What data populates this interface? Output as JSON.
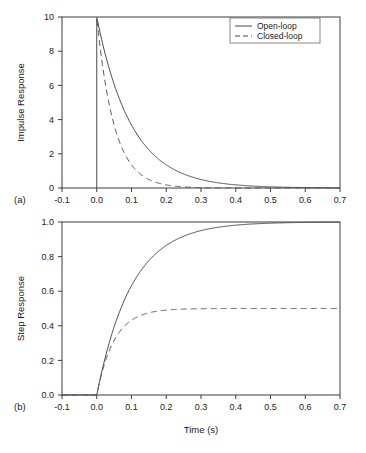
{
  "figure": {
    "background": "#ffffff",
    "line_color": "#4a4a4a",
    "axis_color": "#3c3c3c"
  },
  "caption": {
    "text": ""
  },
  "chart_data": [
    {
      "type": "line",
      "panel": "(a)",
      "title": "",
      "xlabel": "",
      "ylabel": "Impulse Response",
      "xlim": [
        -0.1,
        0.7
      ],
      "ylim": [
        0,
        10
      ],
      "xticks": [
        "-0.1",
        "0.0",
        "0.1",
        "0.2",
        "0.3",
        "0.4",
        "0.5",
        "0.6",
        "0.7"
      ],
      "xtick_values": [
        -0.1,
        0.0,
        0.1,
        0.2,
        0.3,
        0.4,
        0.5,
        0.6,
        0.7
      ],
      "yticks": [
        "0",
        "2",
        "4",
        "6",
        "8",
        "10"
      ],
      "ytick_values": [
        0,
        2,
        4,
        6,
        8,
        10
      ],
      "grid": false,
      "legend_position": "upper right",
      "series": [
        {
          "name": "Open-loop",
          "style": "solid",
          "model": "impulse_exponential",
          "peak": 10,
          "tau": 0.1,
          "x": [
            0.0,
            0.025,
            0.05,
            0.075,
            0.1,
            0.125,
            0.15,
            0.175,
            0.2,
            0.25,
            0.3,
            0.35,
            0.4,
            0.45,
            0.5,
            0.55,
            0.6,
            0.65,
            0.7
          ],
          "values": [
            10.0,
            7.79,
            6.07,
            4.72,
            3.68,
            2.87,
            2.23,
            1.74,
            1.35,
            0.82,
            0.5,
            0.3,
            0.18,
            0.11,
            0.067,
            0.041,
            0.025,
            0.015,
            0.009
          ]
        },
        {
          "name": "Closed-loop",
          "style": "dashed",
          "model": "impulse_exponential",
          "peak": 10,
          "tau": 0.05,
          "x": [
            0.0,
            0.025,
            0.05,
            0.075,
            0.1,
            0.125,
            0.15,
            0.175,
            0.2,
            0.25,
            0.3,
            0.35,
            0.4,
            0.45,
            0.5,
            0.55,
            0.6,
            0.65,
            0.7
          ],
          "values": [
            10.0,
            6.07,
            3.68,
            2.23,
            1.35,
            0.82,
            0.5,
            0.3,
            0.18,
            0.067,
            0.025,
            0.009,
            0.003,
            0.001,
            0.0,
            0.0,
            0.0,
            0.0,
            0.0
          ]
        }
      ]
    },
    {
      "type": "line",
      "panel": "(b)",
      "title": "",
      "xlabel": "Time (s)",
      "ylabel": "Step Response",
      "xlim": [
        -0.1,
        0.7
      ],
      "ylim": [
        0.0,
        1.0
      ],
      "xticks": [
        "-0.1",
        "0.0",
        "0.1",
        "0.2",
        "0.3",
        "0.4",
        "0.5",
        "0.6",
        "0.7"
      ],
      "xtick_values": [
        -0.1,
        0.0,
        0.1,
        0.2,
        0.3,
        0.4,
        0.5,
        0.6,
        0.7
      ],
      "yticks": [
        "0.0",
        "0.2",
        "0.4",
        "0.6",
        "0.8",
        "1.0"
      ],
      "ytick_values": [
        0.0,
        0.2,
        0.4,
        0.6,
        0.8,
        1.0
      ],
      "grid": false,
      "legend_position": "none",
      "series": [
        {
          "name": "Open-loop",
          "style": "solid",
          "model": "step_exponential",
          "final_value": 1.0,
          "tau": 0.1,
          "x": [
            0.0,
            0.025,
            0.05,
            0.075,
            0.1,
            0.125,
            0.15,
            0.175,
            0.2,
            0.25,
            0.3,
            0.35,
            0.4,
            0.45,
            0.5,
            0.55,
            0.6,
            0.65,
            0.7
          ],
          "values": [
            0.0,
            0.221,
            0.393,
            0.528,
            0.632,
            0.713,
            0.777,
            0.826,
            0.865,
            0.918,
            0.95,
            0.97,
            0.982,
            0.989,
            0.993,
            0.996,
            0.998,
            0.998,
            0.999
          ]
        },
        {
          "name": "Closed-loop",
          "style": "dashed",
          "model": "step_exponential",
          "final_value": 0.5,
          "tau": 0.05,
          "x": [
            0.0,
            0.025,
            0.05,
            0.075,
            0.1,
            0.125,
            0.15,
            0.175,
            0.2,
            0.25,
            0.3,
            0.35,
            0.4,
            0.45,
            0.5,
            0.55,
            0.6,
            0.65,
            0.7
          ],
          "values": [
            0.0,
            0.197,
            0.316,
            0.389,
            0.432,
            0.459,
            0.475,
            0.485,
            0.491,
            0.497,
            0.499,
            0.4995,
            0.4998,
            0.4999,
            0.5,
            0.5,
            0.5,
            0.5,
            0.5
          ]
        }
      ]
    }
  ],
  "legend": {
    "items": [
      {
        "label": "Open-loop",
        "style": "solid"
      },
      {
        "label": "Closed-loop",
        "style": "dashed"
      }
    ]
  }
}
